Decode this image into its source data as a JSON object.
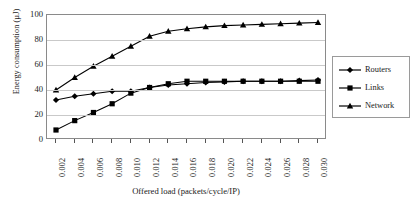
{
  "chart_data": {
    "type": "line",
    "title": "",
    "xlabel": "Offered load (packets/cycle/IP)",
    "ylabel": "Energy consumption (µJ)",
    "categories": [
      "0.002",
      "0.004",
      "0.006",
      "0.008",
      "0.010",
      "0.012",
      "0.014",
      "0.016",
      "0.018",
      "0.020",
      "0.022",
      "0.024",
      "0.026",
      "0.028",
      "0.030"
    ],
    "yticks": [
      0,
      20,
      40,
      60,
      80,
      100
    ],
    "ylim": [
      0,
      100
    ],
    "grid": "horizontal",
    "legend_position": "right",
    "series": [
      {
        "name": "Routers",
        "marker": "diamond",
        "color": "#000000",
        "values": [
          32,
          35,
          37,
          39,
          39,
          42,
          44,
          45,
          46,
          46.5,
          47,
          47,
          47,
          47.5,
          48
        ]
      },
      {
        "name": "Links",
        "marker": "square",
        "color": "#000000",
        "values": [
          8,
          15.5,
          22,
          29,
          37.5,
          42,
          45,
          47,
          47,
          47,
          47,
          47,
          47,
          47,
          47
        ]
      },
      {
        "name": "Network",
        "marker": "triangle",
        "color": "#000000",
        "values": [
          40,
          50,
          59,
          67,
          75,
          83,
          87,
          89,
          90.5,
          91.5,
          92,
          92.5,
          93,
          93.5,
          94
        ]
      }
    ]
  },
  "legend": {
    "items": [
      {
        "label": "Routers",
        "marker": "diamond"
      },
      {
        "label": "Links",
        "marker": "square"
      },
      {
        "label": "Network",
        "marker": "triangle"
      }
    ]
  }
}
